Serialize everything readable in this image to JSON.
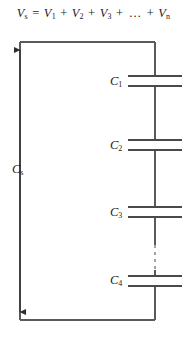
{
  "figure": {
    "background_color": "#ffffff",
    "line_color": "#3c3c3c",
    "text_color": "#1a1a1a"
  },
  "equation": {
    "full_text": "Vs = V1 + V2 + V3 + ... + Vn",
    "lhs_symbol": "V",
    "lhs_sub": "s",
    "equals": "=",
    "terms": [
      {
        "symbol": "V",
        "sub": "1"
      },
      {
        "symbol": "V",
        "sub": "2"
      },
      {
        "symbol": "V",
        "sub": "3"
      },
      {
        "symbol": "…",
        "sub": ""
      },
      {
        "symbol": "V",
        "sub": "n"
      }
    ],
    "plus": "+",
    "ellipsis": "…"
  },
  "circuit": {
    "source_label": {
      "symbol": "C",
      "sub": "s",
      "text": "Cs"
    },
    "arrow_name": "double-headed-vertical-arrow",
    "capacitors": [
      {
        "symbol": "C",
        "sub": "1",
        "text": "C1"
      },
      {
        "symbol": "C",
        "sub": "2",
        "text": "C2"
      },
      {
        "symbol": "C",
        "sub": "3",
        "text": "C3"
      },
      {
        "symbol": "C",
        "sub": "4",
        "text": "C4"
      }
    ],
    "ellipsis_marker": "dashed-vertical-line",
    "loop": {
      "left_x": 20,
      "right_x": 155,
      "top_y": 42,
      "bottom_y": 320
    }
  }
}
